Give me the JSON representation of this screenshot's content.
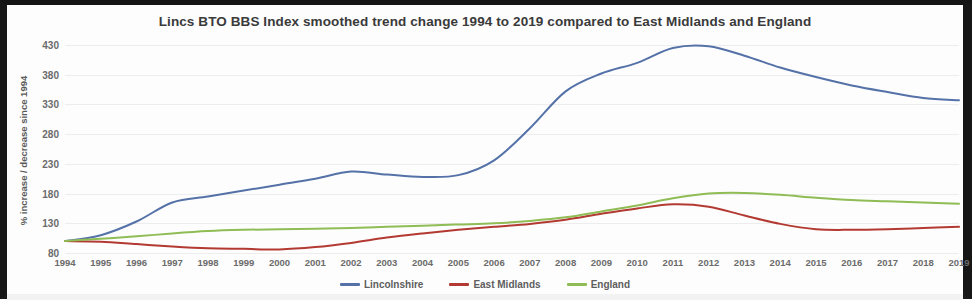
{
  "chart_data": {
    "type": "line",
    "title": "Lincs BTO BBS Index smoothed trend change 1994 to 2019 compared to East Midlands and England",
    "xlabel": "",
    "ylabel": "% increase / decrease since 1994",
    "ylim": [
      80,
      430
    ],
    "yticks": [
      80,
      130,
      180,
      230,
      280,
      330,
      380,
      430
    ],
    "grid": true,
    "legend_position": "bottom",
    "categories": [
      "1994",
      "1995",
      "1996",
      "1997",
      "1998",
      "1999",
      "2000",
      "2001",
      "2002",
      "2003",
      "2004",
      "2005",
      "2006",
      "2007",
      "2008",
      "2009",
      "2010",
      "2011",
      "2012",
      "2013",
      "2014",
      "2015",
      "2016",
      "2017",
      "2018",
      "2019"
    ],
    "series": [
      {
        "name": "Lincolnshire",
        "color": "#5572a8",
        "values": [
          100,
          110,
          133,
          165,
          175,
          185,
          195,
          205,
          217,
          212,
          208,
          211,
          236,
          290,
          352,
          382,
          400,
          425,
          428,
          412,
          392,
          376,
          362,
          351,
          341,
          337
        ]
      },
      {
        "name": "East Midlands",
        "color": "#b33a32",
        "values": [
          100,
          99,
          95,
          91,
          88,
          87,
          86,
          90,
          97,
          106,
          113,
          119,
          124,
          129,
          136,
          146,
          155,
          162,
          158,
          143,
          129,
          120,
          119,
          120,
          122,
          124
        ]
      },
      {
        "name": "England",
        "color": "#8fbc55",
        "values": [
          100,
          104,
          108,
          113,
          117,
          119,
          120,
          121,
          122,
          124,
          126,
          128,
          130,
          134,
          140,
          150,
          160,
          172,
          180,
          181,
          178,
          173,
          169,
          167,
          165,
          163
        ]
      }
    ]
  },
  "legend": {
    "items": [
      {
        "label": "Lincolnshire",
        "color": "#5572a8"
      },
      {
        "label": "East Midlands",
        "color": "#b33a32"
      },
      {
        "label": "England",
        "color": "#8fbc55"
      }
    ]
  }
}
